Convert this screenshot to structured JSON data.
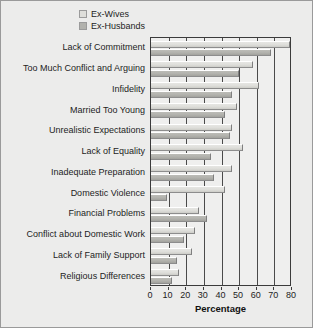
{
  "chart_data": {
    "type": "bar",
    "orientation": "horizontal",
    "title": "",
    "xlabel": "Percentage",
    "ylabel": "",
    "xlim": [
      0,
      80
    ],
    "xticks": [
      0,
      10,
      20,
      30,
      40,
      50,
      60,
      70,
      80
    ],
    "grid": true,
    "legend_position": "top",
    "categories": [
      "Lack of Commitment",
      "Too Much Conflict and Arguing",
      "Infidelity",
      "Married Too Young",
      "Unrealistic Expectations",
      "Lack of Equality",
      "Inadequate Preparation",
      "Domestic Violence",
      "Financial Problems",
      "Conflict about Domestic Work",
      "Lack of Family Support",
      "Religious Differences"
    ],
    "series": [
      {
        "name": "Ex-Wives",
        "color": "#dededa",
        "values": [
          79,
          58,
          61,
          49,
          46,
          52,
          46,
          42,
          27,
          25,
          23,
          16
        ]
      },
      {
        "name": "Ex-Husbands",
        "color": "#b2b2ad",
        "values": [
          68,
          50,
          46,
          42,
          45,
          34,
          36,
          9,
          32,
          19,
          15,
          12
        ]
      }
    ]
  },
  "legend": {
    "items": [
      {
        "label": "Ex-Wives",
        "swatch": "#dededa"
      },
      {
        "label": "Ex-Husbands",
        "swatch": "#b2b2ad"
      }
    ]
  },
  "axis": {
    "x_title": "Percentage",
    "tick_labels": [
      "0",
      "10",
      "20",
      "30",
      "40",
      "50",
      "60",
      "70",
      "80"
    ]
  },
  "style": {
    "figure_background": "#ececeb",
    "plot_background": "#efefee",
    "frame_color": "#3b3b3b"
  }
}
